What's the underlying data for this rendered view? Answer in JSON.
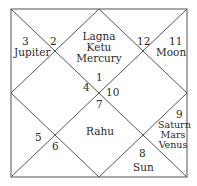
{
  "chart": {
    "style": "North Indian",
    "line_color": "#555555",
    "houses": [
      {
        "number": "1",
        "planets": [
          "Lagna",
          "Ketu",
          "Mercury"
        ]
      },
      {
        "number": "2",
        "planets": []
      },
      {
        "number": "3",
        "planets": [
          "Jupiter"
        ]
      },
      {
        "number": "4",
        "planets": []
      },
      {
        "number": "5",
        "planets": []
      },
      {
        "number": "6",
        "planets": []
      },
      {
        "number": "7",
        "planets": [
          "Rahu"
        ]
      },
      {
        "number": "8",
        "planets": [
          "Sun"
        ]
      },
      {
        "number": "9",
        "planets": [
          "Saturn",
          "Mars",
          "Venus"
        ]
      },
      {
        "number": "10",
        "planets": []
      },
      {
        "number": "11",
        "planets": [
          "Moon"
        ]
      },
      {
        "number": "12",
        "planets": []
      }
    ]
  }
}
